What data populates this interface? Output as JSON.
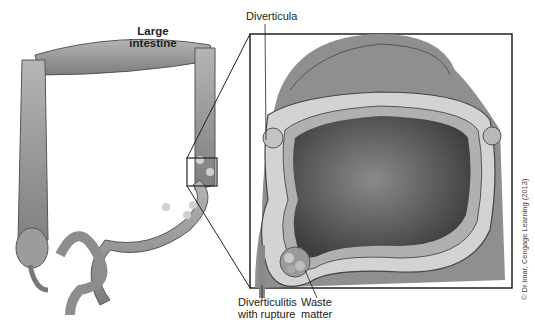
{
  "figure": {
    "title_line1": "Large",
    "title_line2": "intestine",
    "labels": {
      "diverticula": "Diverticula",
      "diverticulitis_line1": "Diverticulitis",
      "diverticulitis_line2": "with rupture",
      "waste_line1": "Waste",
      "waste_line2": "matter"
    },
    "credit": "© Dr.Imar, Cengage Learning (2013)",
    "colors": {
      "tissue": "#9a9a9a",
      "tissue_light": "#c8c8c8",
      "lumen": "#555555",
      "outline": "#222222"
    }
  }
}
